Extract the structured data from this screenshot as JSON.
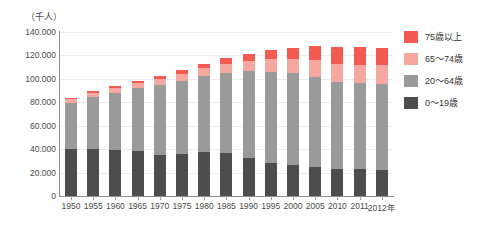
{
  "chart_data": {
    "type": "bar",
    "stacked": true,
    "title": "",
    "subtitle": "",
    "xlabel": "",
    "ylabel": "（千人）",
    "ylim": [
      0,
      140000
    ],
    "ytick_labels": [
      "140.000",
      "120.000",
      "100.000",
      "80.000",
      "60.000",
      "40.000",
      "20.000",
      "0"
    ],
    "ytick_values": [
      140000,
      120000,
      100000,
      80000,
      60000,
      40000,
      20000,
      0
    ],
    "grid": true,
    "legend_position": "right",
    "categories": [
      "1950",
      "1955",
      "1960",
      "1965",
      "1970",
      "1975",
      "1980",
      "1985",
      "1990",
      "1995",
      "2000",
      "2005",
      "2010",
      "2011",
      "2012年"
    ],
    "series": [
      {
        "name": "0～19歳",
        "color": "#4d4d4d",
        "values": [
          39800,
          40500,
          39000,
          38500,
          34800,
          36000,
          37500,
          36800,
          32500,
          28500,
          26500,
          24500,
          23000,
          22800,
          22500
        ]
      },
      {
        "name": "20～64歳",
        "color": "#9a9a9a",
        "values": [
          39700,
          44000,
          49000,
          53500,
          60000,
          62500,
          65000,
          68500,
          74000,
          77500,
          78500,
          77500,
          74500,
          74000,
          73500
        ]
      },
      {
        "name": "65～74歳",
        "color": "#f5a8a0",
        "values": [
          3100,
          3400,
          3900,
          4600,
          5200,
          6000,
          6700,
          7800,
          8900,
          11100,
          12300,
          14100,
          15200,
          15300,
          15600
        ]
      },
      {
        "name": "75歳以上",
        "color": "#f15b52",
        "values": [
          1100,
          1400,
          1700,
          2000,
          2300,
          2900,
          3700,
          4700,
          5900,
          7200,
          9000,
          11600,
          14200,
          14800,
          15100
        ]
      }
    ],
    "totals": [
      83700,
      89300,
      93600,
      98600,
      102300,
      107400,
      112900,
      117800,
      121300,
      124300,
      126300,
      127700,
      126900,
      126900,
      126700
    ]
  },
  "legend": {
    "items": [
      {
        "label": "75歳以上",
        "color": "#f15b52"
      },
      {
        "label": "65～74歳",
        "color": "#f5a8a0"
      },
      {
        "label": "20～64歳",
        "color": "#9a9a9a"
      },
      {
        "label": "0～19歳",
        "color": "#4d4d4d"
      }
    ]
  }
}
